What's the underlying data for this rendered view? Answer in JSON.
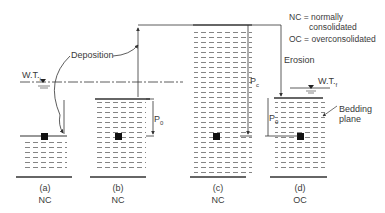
{
  "legend": {
    "nc_line1": "NC = normally",
    "nc_line2": "consolidated",
    "oc_line": "OC = overconsolidated"
  },
  "annotations": {
    "deposition": "Deposition",
    "erosion": "Erosion",
    "wt_initial": "W.T.",
    "wt_initial_sub": "i",
    "wt_final": "W.T.",
    "wt_final_sub": "f",
    "p0_b": "P",
    "p0_b_sub": "0",
    "pc": "P",
    "pc_sub": "c",
    "p0_d": "P",
    "p0_d_sub": "0",
    "bedding_plane_1": "Bedding",
    "bedding_plane_2": "plane"
  },
  "panels": [
    {
      "id": "a",
      "label": "(a)",
      "state": "NC"
    },
    {
      "id": "b",
      "label": "(b)",
      "state": "NC"
    },
    {
      "id": "c",
      "label": "(c)",
      "state": "NC"
    },
    {
      "id": "d",
      "label": "(d)",
      "state": "OC"
    }
  ],
  "colors": {
    "line": "#333333",
    "hatch": "#555555",
    "element": "#111111"
  }
}
